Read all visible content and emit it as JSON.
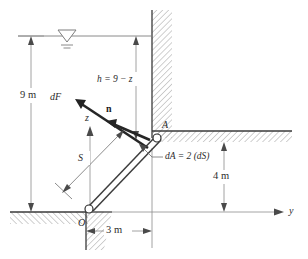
{
  "figure": {
    "labels": {
      "depth_total": "9 m",
      "depth_head": "h = 9 − z",
      "horizontal_offset": "3 m",
      "vertical_offset": "4 m",
      "force_element": "dF",
      "normal_vector": "n",
      "arc_length": "S",
      "area_element": "dA = 2 (dS)",
      "axis_z": "z",
      "axis_y": "y",
      "hinge_lower": "O",
      "hinge_upper": "A"
    },
    "icons": {
      "water_surface": "free-surface-triangle-icon",
      "hinge": "pin-hinge-circle-icon",
      "arrowhead": "arrowhead-icon"
    },
    "colors": {
      "ink": "#2b2b2b",
      "thin_rule": "#8e8e8e",
      "hatch": "#7a7a7a",
      "solid_edge": "#3a3a3a",
      "force": "#262626",
      "background": "#ffffff"
    },
    "geometry": {
      "water_surface_y_px": 36,
      "ground_y_px": 212,
      "wall_x_px": 152,
      "hinge_O_px": [
        86,
        209
      ],
      "hinge_A_px": [
        154,
        138
      ],
      "total_depth_m": 9,
      "horizontal_span_m": 3,
      "ledge_height_m": 4,
      "width_factor": 2
    }
  }
}
